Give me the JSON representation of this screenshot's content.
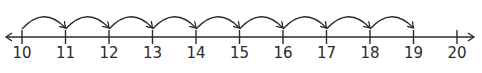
{
  "number_line": {
    "start": 10,
    "end": 20,
    "step": 1,
    "labels": [
      "10",
      "11",
      "12",
      "13",
      "14",
      "15",
      "16",
      "17",
      "18",
      "19",
      "20"
    ],
    "hops": [
      {
        "from": 10,
        "to": 11
      },
      {
        "from": 11,
        "to": 12
      },
      {
        "from": 12,
        "to": 13
      },
      {
        "from": 13,
        "to": 14
      },
      {
        "from": 14,
        "to": 15
      },
      {
        "from": 15,
        "to": 16
      },
      {
        "from": 16,
        "to": 17
      },
      {
        "from": 17,
        "to": 18
      },
      {
        "from": 18,
        "to": 19
      }
    ],
    "line_color": "#2b2b2b"
  }
}
